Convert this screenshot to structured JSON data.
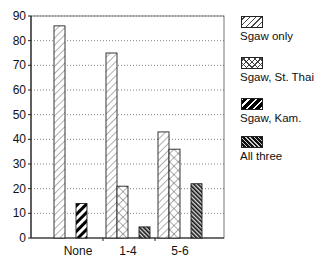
{
  "chart_data": {
    "type": "bar",
    "title": "",
    "xlabel": "",
    "ylabel": "",
    "categories": [
      "None",
      "1-4",
      "5-6"
    ],
    "series": [
      {
        "name": "Sgaw only",
        "pattern": "light-diagonal",
        "values": [
          86,
          75,
          43
        ]
      },
      {
        "name": "Sgaw, St. Thai",
        "pattern": "crosshatch",
        "values": [
          0,
          21,
          36
        ]
      },
      {
        "name": "Sgaw, Kam.",
        "pattern": "bold-diagonal",
        "values": [
          14,
          0,
          0
        ]
      },
      {
        "name": "All three",
        "pattern": "dark-diagonal",
        "values": [
          0,
          4.5,
          22
        ]
      }
    ],
    "ylim": [
      0,
      90
    ],
    "yticks": [
      0,
      10,
      20,
      30,
      40,
      50,
      60,
      70,
      80,
      90
    ],
    "grid": "horizontal-dotted",
    "legend_position": "right"
  },
  "legend": {
    "items": [
      {
        "label": "Sgaw only"
      },
      {
        "label": "Sgaw, St. Thai"
      },
      {
        "label": "Sgaw, Kam."
      },
      {
        "label": "All three"
      }
    ]
  }
}
